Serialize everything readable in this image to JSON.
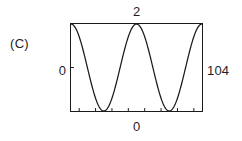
{
  "figure": {
    "panel_label": "(C)",
    "background_color": "#ffffff",
    "stroke_color": "#1b1b1b"
  },
  "axes": {
    "top_label": "2",
    "bottom_label": "0",
    "left_label": "0",
    "right_label": "104"
  },
  "chart_data": {
    "type": "line",
    "title": "",
    "subtitle": "",
    "xlabel": "",
    "ylabel": "",
    "annotations": [
      "(C)"
    ],
    "legend": [],
    "legend_position": "none",
    "grid": false,
    "frame": true,
    "xlim": [
      0,
      2
    ],
    "ylim": [
      0,
      104
    ],
    "xticks": [
      0,
      2
    ],
    "xticklabels": [
      "0",
      "2"
    ],
    "yticks": [
      0,
      104
    ],
    "yticklabels": [
      "0",
      "104"
    ],
    "minor_xticks": [
      0.125,
      0.375,
      0.625,
      0.875,
      1.125,
      1.375,
      1.625,
      1.875
    ],
    "minor_yticks": [
      52
    ],
    "series": [
      {
        "name": "cosine",
        "formula": "y = 52 * (1 + cos(2*pi*2*x))",
        "period": 1.0,
        "amplitude": 52,
        "offset": 52,
        "peaks_x": [
          0.0,
          1.0,
          2.0
        ],
        "troughs_x": [
          0.5,
          1.5
        ],
        "x": [
          0.0,
          0.05,
          0.1,
          0.15,
          0.2,
          0.25,
          0.3,
          0.35,
          0.4,
          0.45,
          0.5,
          0.55,
          0.6,
          0.65,
          0.7,
          0.75,
          0.8,
          0.85,
          0.9,
          0.95,
          1.0,
          1.05,
          1.1,
          1.15,
          1.2,
          1.25,
          1.3,
          1.35,
          1.4,
          1.45,
          1.5,
          1.55,
          1.6,
          1.65,
          1.7,
          1.75,
          1.8,
          1.85,
          1.9,
          1.95,
          2.0
        ],
        "values": [
          104.0,
          101.5,
          94.2,
          82.7,
          68.1,
          52.0,
          35.9,
          21.3,
          9.8,
          2.5,
          0.0,
          2.5,
          9.8,
          21.3,
          35.9,
          52.0,
          68.1,
          82.7,
          94.2,
          101.5,
          104.0,
          101.5,
          94.2,
          82.7,
          68.1,
          52.0,
          35.9,
          21.3,
          9.8,
          2.5,
          0.0,
          2.5,
          9.8,
          21.3,
          35.9,
          52.0,
          68.1,
          82.7,
          94.2,
          101.5,
          104.0
        ]
      }
    ]
  }
}
